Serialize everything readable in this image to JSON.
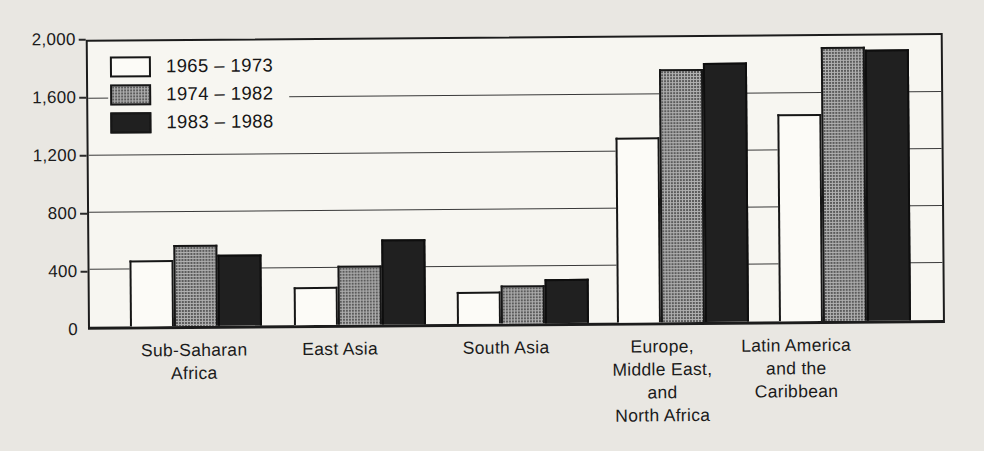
{
  "figure": {
    "kind": "scanned grouped bar chart",
    "paper_color": "#e9e7e2",
    "plot_background": "#f7f6f1",
    "frame_color": "#1c1c1c"
  },
  "chart_data": {
    "type": "bar",
    "title": "",
    "xlabel": "",
    "ylabel": "",
    "categories": [
      "Sub-Saharan Africa",
      "East Asia",
      "South Asia",
      "Europe, Middle East, and North Africa",
      "Latin America and the Caribbean"
    ],
    "category_lines": [
      [
        "Sub-Saharan",
        "Africa"
      ],
      [
        "East Asia"
      ],
      [
        "South Asia"
      ],
      [
        "Europe,",
        "Middle East,",
        "and",
        "North Africa"
      ],
      [
        "Latin America",
        "and the",
        "Caribbean"
      ]
    ],
    "series": [
      {
        "name": "1965 – 1973",
        "fill": "#fcfbf7",
        "pattern": "plain",
        "values": [
          460,
          270,
          225,
          1300,
          1450
        ]
      },
      {
        "name": "1974 – 1982",
        "fill": "#b0b0b0",
        "pattern": "halftone",
        "values": [
          570,
          415,
          270,
          1775,
          1920
        ]
      },
      {
        "name": "1983 – 1988",
        "fill": "#202020",
        "pattern": "solid",
        "values": [
          500,
          600,
          310,
          1820,
          1900
        ]
      }
    ],
    "ylim": [
      0,
      2000
    ],
    "yticks": [
      0,
      400,
      800,
      1200,
      1600,
      2000
    ],
    "ytick_labels": [
      "0",
      "400",
      "800",
      "1,200",
      "1,600",
      "2,000"
    ],
    "grid": true,
    "gridline_values": [
      400,
      800,
      1200,
      1600
    ],
    "legend_position": "top-left"
  }
}
